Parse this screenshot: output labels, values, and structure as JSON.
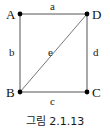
{
  "figure": {
    "caption": "그림 2.1.13",
    "background_color": "#ffffff",
    "line_color": "#555555",
    "vertex_color": "#000000",
    "text_color": "#1a1a1a"
  },
  "vertices": [
    {
      "id": "A",
      "label": "A",
      "x": 20,
      "y": 14
    },
    {
      "id": "D",
      "label": "D",
      "x": 87,
      "y": 14
    },
    {
      "id": "B",
      "label": "B",
      "x": 20,
      "y": 92
    },
    {
      "id": "C",
      "label": "C",
      "x": 87,
      "y": 92
    }
  ],
  "edges": [
    {
      "id": "a",
      "label": "a",
      "from": "A",
      "to": "D",
      "position": "top"
    },
    {
      "id": "b",
      "label": "b",
      "from": "A",
      "to": "B",
      "position": "left"
    },
    {
      "id": "c",
      "label": "c",
      "from": "B",
      "to": "C",
      "position": "bottom"
    },
    {
      "id": "d",
      "label": "d",
      "from": "D",
      "to": "C",
      "position": "right"
    },
    {
      "id": "e",
      "label": "e",
      "from": "B",
      "to": "D",
      "position": "diagonal"
    }
  ]
}
